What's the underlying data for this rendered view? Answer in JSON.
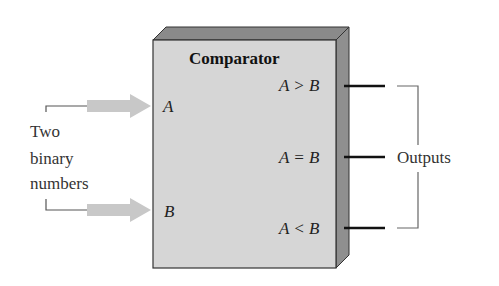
{
  "diagram": {
    "block": {
      "title": "Comparator",
      "input_a": "A",
      "input_b": "B",
      "outputs": [
        "A > B",
        "A = B",
        "A < B"
      ],
      "colors": {
        "front": "#d6d6d6",
        "top": "#8a8a8a",
        "side": "#8f8f8f",
        "edge": "#333333"
      }
    },
    "left_label": [
      "Two",
      "binary",
      "numbers"
    ],
    "right_label": "Outputs",
    "arrow_color": "#c8c8c8"
  }
}
